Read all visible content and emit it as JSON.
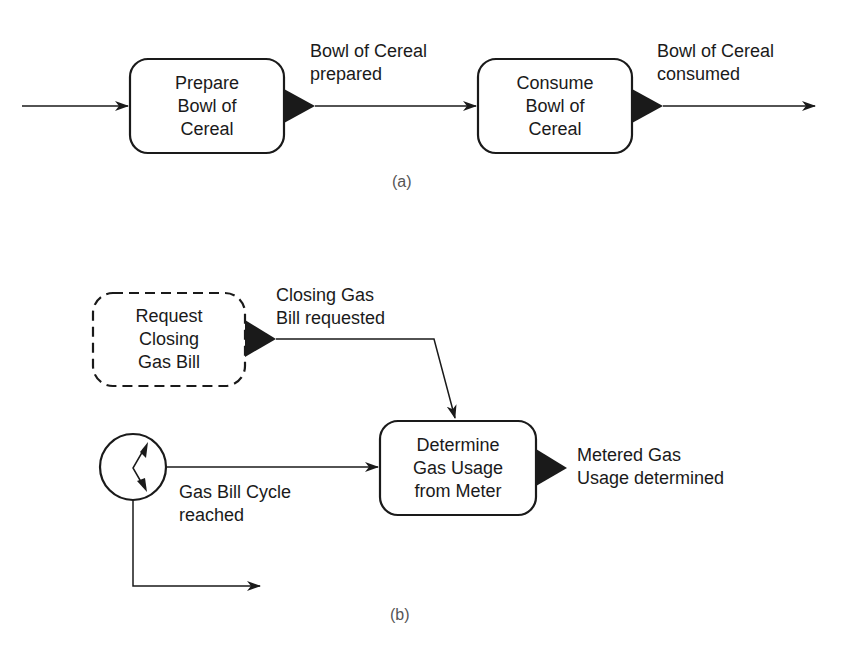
{
  "colors": {
    "stroke": "#1a1a1a",
    "background": "#ffffff",
    "caption": "#555555"
  },
  "diagram_a": {
    "caption": "(a)",
    "nodes": [
      {
        "id": "prepare",
        "label": "Prepare\nBowl of\nCereal",
        "style": "solid-rounded"
      },
      {
        "id": "consume",
        "label": "Consume\nBowl of\nCereal",
        "style": "solid-rounded"
      }
    ],
    "events": [
      {
        "from": "prepare",
        "label": "Bowl of Cereal\nprepared"
      },
      {
        "from": "consume",
        "label": "Bowl of Cereal\nconsumed"
      }
    ]
  },
  "diagram_b": {
    "caption": "(b)",
    "nodes": [
      {
        "id": "request",
        "label": "Request\nClosing\nGas Bill",
        "style": "dashed-rounded"
      },
      {
        "id": "determine",
        "label": "Determine\nGas Usage\nfrom Meter",
        "style": "solid-rounded"
      },
      {
        "id": "timer",
        "icon": "clock-timer-icon",
        "style": "circle"
      }
    ],
    "events": [
      {
        "from": "request",
        "label": "Closing Gas\nBill requested"
      },
      {
        "from": "timer",
        "label": "Gas Bill Cycle\nreached"
      },
      {
        "from": "determine",
        "label": "Metered Gas\nUsage determined"
      }
    ]
  }
}
